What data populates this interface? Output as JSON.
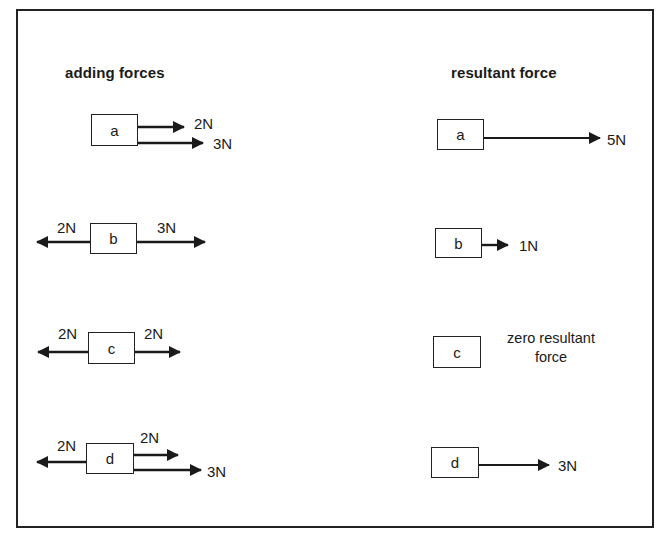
{
  "diagram": {
    "left_heading": "adding forces",
    "right_heading": "resultant force",
    "adding": [
      {
        "id": "a",
        "box_label": "a",
        "forces": [
          {
            "direction": "right",
            "magnitude": "2N"
          },
          {
            "direction": "right",
            "magnitude": "3N"
          }
        ]
      },
      {
        "id": "b",
        "box_label": "b",
        "forces": [
          {
            "direction": "left",
            "magnitude": "2N"
          },
          {
            "direction": "right",
            "magnitude": "3N"
          }
        ]
      },
      {
        "id": "c",
        "box_label": "c",
        "forces": [
          {
            "direction": "left",
            "magnitude": "2N"
          },
          {
            "direction": "right",
            "magnitude": "2N"
          }
        ]
      },
      {
        "id": "d",
        "box_label": "d",
        "forces": [
          {
            "direction": "left",
            "magnitude": "2N"
          },
          {
            "direction": "right",
            "magnitude": "2N"
          },
          {
            "direction": "right",
            "magnitude": "3N"
          }
        ]
      }
    ],
    "resultant": [
      {
        "id": "a",
        "box_label": "a",
        "direction": "right",
        "magnitude": "5N"
      },
      {
        "id": "b",
        "box_label": "b",
        "direction": "right",
        "magnitude": "1N"
      },
      {
        "id": "c",
        "box_label": "c",
        "direction": "none",
        "note_line1": "zero resultant",
        "note_line2": "force"
      },
      {
        "id": "d",
        "box_label": "d",
        "direction": "right",
        "magnitude": "3N"
      }
    ]
  }
}
